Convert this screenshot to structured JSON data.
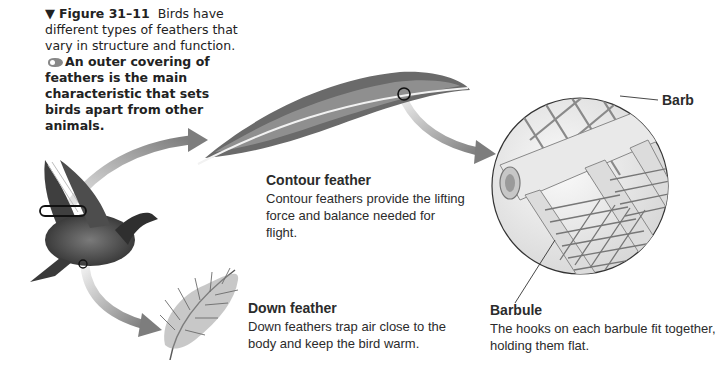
{
  "figure": {
    "marker": "▼",
    "number": "Figure 31–11",
    "caption_regular": "Birds have different types of feathers that vary in structure and function.",
    "caption_bold": "An outer covering of feathers is the main characteristic that sets birds apart from other animals."
  },
  "labels": {
    "contour": {
      "title": "Contour feather",
      "description": "Contour feathers provide the lifting force and balance needed for flight."
    },
    "down": {
      "title": "Down feather",
      "description": "Down feathers trap air close to the body and keep the bird warm."
    },
    "barbule": {
      "title": "Barbule",
      "description": "The hooks on each barbule fit together, holding them flat."
    },
    "barb": {
      "title": "Barb"
    }
  },
  "colors": {
    "arrow": "#8a8a8a",
    "ink": "#2b2b2b",
    "bird": "#4a4a4a"
  }
}
